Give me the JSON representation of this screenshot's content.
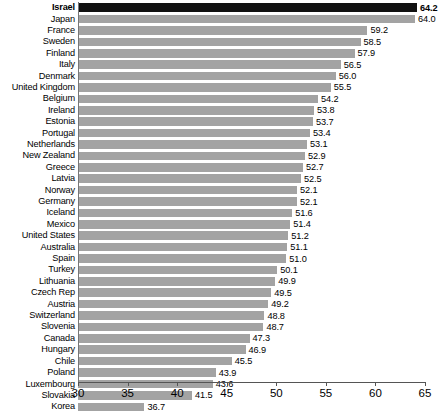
{
  "chart_data": {
    "type": "bar",
    "orientation": "horizontal",
    "title": "",
    "subtitle": "",
    "xlabel": "",
    "ylabel": "",
    "xlim": [
      30,
      65
    ],
    "xticks": [
      30,
      35,
      40,
      45,
      50,
      55,
      60,
      65
    ],
    "xtick_labels": [
      "30",
      "35",
      "40",
      "45",
      "50",
      "55",
      "60",
      "65"
    ],
    "grid": false,
    "legend": "none",
    "highlight_category": "Israel",
    "colors": {
      "bar": "#a3a3a3",
      "highlight_bar": "#111111",
      "axis": "#555555",
      "text": "#000000",
      "background": "#ffffff"
    },
    "categories": [
      "Israel",
      "Japan",
      "France",
      "Sweden",
      "Finland",
      "Italy",
      "Denmark",
      "United Kingdom",
      "Belgium",
      "Ireland",
      "Estonia",
      "Portugal",
      "Netherlands",
      "New Zealand",
      "Greece",
      "Latvia",
      "Norway",
      "Germany",
      "Iceland",
      "Mexico",
      "United States",
      "Australia",
      "Spain",
      "Turkey",
      "Lithuania",
      "Czech Rep",
      "Austria",
      "Switzerland",
      "Slovenia",
      "Canada",
      "Hungary",
      "Chile",
      "Poland",
      "Luxembourg",
      "Slovakia",
      "Korea"
    ],
    "values": [
      64.2,
      64.0,
      59.2,
      58.5,
      57.9,
      56.5,
      56.0,
      55.5,
      54.2,
      53.8,
      53.7,
      53.4,
      53.1,
      52.9,
      52.7,
      52.5,
      52.1,
      52.1,
      51.6,
      51.4,
      51.2,
      51.1,
      51.0,
      50.1,
      49.9,
      49.5,
      49.2,
      48.8,
      48.7,
      47.3,
      46.9,
      45.5,
      43.9,
      43.6,
      41.5,
      36.7
    ],
    "value_labels": [
      "64.2",
      "64.0",
      "59.2",
      "58.5",
      "57.9",
      "56.5",
      "56.0",
      "55.5",
      "54.2",
      "53.8",
      "53.7",
      "53.4",
      "53.1",
      "52.9",
      "52.7",
      "52.5",
      "52.1",
      "52.1",
      "51.6",
      "51.4",
      "51.2",
      "51.1",
      "51.0",
      "50.1",
      "49.9",
      "49.5",
      "49.2",
      "48.8",
      "48.7",
      "47.3",
      "46.9",
      "45.5",
      "43.9",
      "43.6",
      "41.5",
      "36.7"
    ]
  }
}
